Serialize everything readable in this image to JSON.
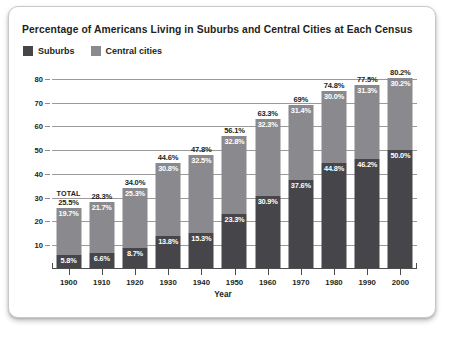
{
  "card": {
    "title": "Percentage of Americans Living in Suburbs and Central Cities at Each Census"
  },
  "legend": {
    "items": [
      {
        "label": "Suburbs",
        "color": "#46464a"
      },
      {
        "label": "Central cities",
        "color": "#8a8a8e"
      }
    ]
  },
  "annotations": {
    "total_word": "TOTAL"
  },
  "chart_data": {
    "type": "bar",
    "subtype": "stacked-bar",
    "title": "Percentage of Americans Living in Suburbs and Central Cities at Each Census",
    "xlabel": "Year",
    "ylabel": "",
    "ylim": [
      0,
      85
    ],
    "yticks": [
      10,
      20,
      30,
      40,
      50,
      60,
      70,
      80
    ],
    "ytick_labels": [
      "10",
      "20",
      "30",
      "40",
      "50",
      "60",
      "70",
      "80"
    ],
    "grid": true,
    "legend_position": "top-left",
    "categories": [
      "1900",
      "1910",
      "1920",
      "1930",
      "1940",
      "1950",
      "1960",
      "1970",
      "1980",
      "1990",
      "2000"
    ],
    "series": [
      {
        "name": "Suburbs",
        "color": "#46464a",
        "values": [
          5.8,
          6.6,
          8.7,
          13.8,
          15.3,
          23.3,
          30.9,
          37.6,
          44.8,
          46.2,
          50.0
        ],
        "labels": [
          "5.8%",
          "6.6%",
          "8.7%",
          "13.8%",
          "15.3%",
          "23.3%",
          "30.9%",
          "37.6%",
          "44.8%",
          "46.2%",
          "50.0%"
        ]
      },
      {
        "name": "Central cities",
        "color": "#8a8a8e",
        "values": [
          19.7,
          21.7,
          25.3,
          30.8,
          32.5,
          32.8,
          32.3,
          31.4,
          30.0,
          31.3,
          30.2
        ],
        "labels": [
          "19.7%",
          "21.7%",
          "25.3%",
          "30.8%",
          "32.5%",
          "32.8%",
          "32.3%",
          "31.4%",
          "30.0%",
          "31.3%",
          "30.2%"
        ]
      }
    ],
    "totals": [
      25.5,
      28.3,
      34.0,
      44.6,
      47.8,
      56.1,
      63.3,
      69.0,
      74.8,
      77.5,
      80.2
    ],
    "total_labels": [
      "25.5%",
      "28.3%",
      "34.0%",
      "44.6%",
      "47.8%",
      "56.1%",
      "63.3%",
      "69%",
      "74.8%",
      "77.5%",
      "80.2%"
    ]
  }
}
